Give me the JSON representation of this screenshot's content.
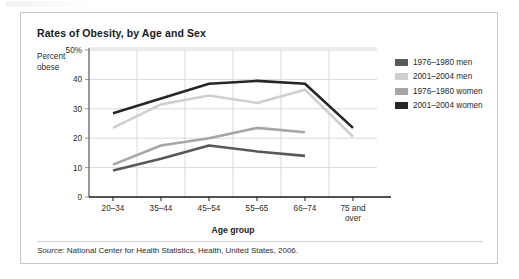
{
  "figure": {
    "title": "Rates of Obesity, by Age and Sex",
    "y_axis_label_line1": "Percent",
    "y_axis_label_line2": "obese",
    "x_axis_title": "Age group",
    "source_prefix": "Source:",
    "source_text": "National Center for Health Statistics, Health, United States, 2006."
  },
  "legend": {
    "position": "right",
    "items": [
      {
        "label": "1976–1980 men",
        "color": "#595959"
      },
      {
        "label": "2001–2004 men",
        "color": "#cfcfcf"
      },
      {
        "label": "1976–1980 women",
        "color": "#a6a6a6"
      },
      {
        "label": "2001–2004 women",
        "color": "#262626"
      }
    ]
  },
  "chart_data": {
    "type": "line",
    "title": "Rates of Obesity, by Age and Sex",
    "xlabel": "Age group",
    "ylabel": "Percent obese",
    "categories": [
      "20–34",
      "35–44",
      "45–54",
      "55–65",
      "66–74",
      "75 and over"
    ],
    "category_labels": [
      [
        "20–34"
      ],
      [
        "35–44"
      ],
      [
        "45–54"
      ],
      [
        "55–65"
      ],
      [
        "66–74"
      ],
      [
        "75 and",
        "over"
      ]
    ],
    "ylim": [
      0,
      50
    ],
    "yticks": [
      0,
      10,
      20,
      30,
      40,
      50
    ],
    "ytick_labels": [
      "0",
      "10",
      "20",
      "30",
      "40",
      "50%"
    ],
    "grid": true,
    "series": [
      {
        "name": "1976–1980 men",
        "color": "#595959",
        "values": [
          9.0,
          13.0,
          17.5,
          15.5,
          14.0,
          null
        ]
      },
      {
        "name": "2001–2004 men",
        "color": "#cfcfcf",
        "values": [
          23.5,
          31.5,
          34.5,
          32.0,
          36.5,
          20.5
        ]
      },
      {
        "name": "1976–1980 women",
        "color": "#a6a6a6",
        "values": [
          11.0,
          17.5,
          20.0,
          23.5,
          22.0,
          null
        ]
      },
      {
        "name": "2001–2004 women",
        "color": "#262626",
        "values": [
          28.5,
          33.5,
          38.5,
          39.5,
          38.5,
          23.5
        ]
      }
    ]
  }
}
